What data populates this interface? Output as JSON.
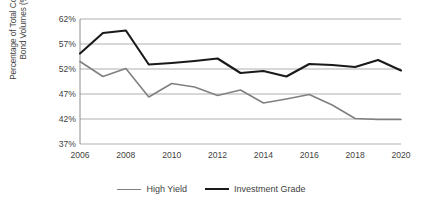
{
  "chart_data": {
    "type": "line",
    "title": "",
    "xlabel": "",
    "ylabel": "Percentage of Total Corporate Bond Volumes (%)",
    "ylabel_line1": "Percentage of Total Corporate",
    "ylabel_line2": "Bond Volumes (%)",
    "x": [
      2006,
      2007,
      2008,
      2009,
      2010,
      2011,
      2012,
      2013,
      2014,
      2015,
      2016,
      2017,
      2018,
      2019,
      2020
    ],
    "categories": [
      "2006",
      "2007",
      "2008",
      "2009",
      "2010",
      "2011",
      "2012",
      "2013",
      "2014",
      "2015",
      "2016",
      "2017",
      "2018",
      "2019",
      "2020"
    ],
    "xtick_labels": [
      "2006",
      "2008",
      "2010",
      "2012",
      "2014",
      "2016",
      "2018",
      "2020"
    ],
    "xtick_values": [
      2006,
      2008,
      2010,
      2012,
      2014,
      2016,
      2018,
      2020
    ],
    "ytick_labels": [
      "62%",
      "57%",
      "52%",
      "47%",
      "42%",
      "37%"
    ],
    "ytick_values": [
      62,
      57,
      52,
      47,
      42,
      37
    ],
    "ylim": [
      37,
      62
    ],
    "xlim": [
      2006,
      2020
    ],
    "grid": true,
    "grid_axis": "y",
    "legend_position": "bottom",
    "series": [
      {
        "name": "High Yield",
        "color": "#808080",
        "width": 1.6,
        "values": [
          53.5,
          50.5,
          52.1,
          46.4,
          49.1,
          48.4,
          46.7,
          47.8,
          45.2,
          46.0,
          46.9,
          44.8,
          42.1,
          41.9,
          41.9
        ]
      },
      {
        "name": "Investment Grade",
        "color": "#1a1a1a",
        "width": 2.1,
        "values": [
          55.1,
          59.2,
          59.7,
          52.9,
          53.2,
          53.6,
          54.1,
          51.2,
          51.6,
          50.5,
          53.0,
          52.8,
          52.4,
          53.8,
          51.7
        ]
      }
    ]
  },
  "legend": {
    "items": [
      {
        "label": "High Yield",
        "color": "#808080",
        "thickness": "1.6px"
      },
      {
        "label": "Investment Grade",
        "color": "#1a1a1a",
        "thickness": "2.2px"
      }
    ]
  },
  "style": {
    "background": "#ffffff",
    "grid_color": "#a6a6a6",
    "axis_color": "#808080",
    "text_color": "#3f3f3f"
  }
}
